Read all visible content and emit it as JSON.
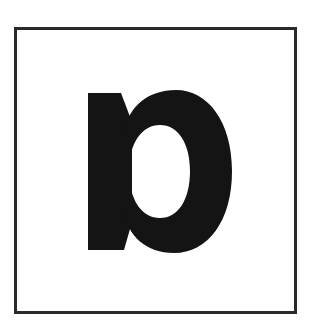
{
  "sign": {
    "symbol": "p",
    "symbol_description": "bold black reversed-stem 'p' glyph inside a square frame",
    "colors": {
      "background": "#ffffff",
      "frame_border": "#2a2a2a",
      "glyph_fill": "#141414"
    }
  }
}
